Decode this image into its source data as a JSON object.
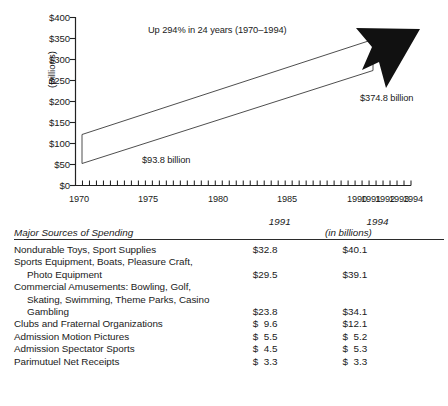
{
  "chart_data": {
    "type": "area",
    "title": "Up 294% in 24 years (1970–1994)",
    "xlabel": "",
    "ylabel": "(Billions)",
    "ylim": [
      0,
      400
    ],
    "xlim": [
      1970,
      1994
    ],
    "grid": false,
    "legend": "none",
    "y_ticks": [
      "$0",
      "$50",
      "$100",
      "$150",
      "$200",
      "$250",
      "$300",
      "$350",
      "$400"
    ],
    "y_tick_values": [
      0,
      50,
      100,
      150,
      200,
      250,
      300,
      350,
      400
    ],
    "x_ticks": [
      "1970",
      "1975",
      "1980",
      "1985",
      "1990",
      "1991",
      "1992",
      "1993",
      "1994"
    ],
    "x_tick_values": [
      1970,
      1975,
      1980,
      1985,
      1990,
      1991,
      1992,
      1993,
      1994
    ],
    "minor_ticks_per_year": 2,
    "x": [
      1970,
      1994
    ],
    "values": [
      93.8,
      374.8
    ],
    "annotations": [
      {
        "name": "start-value",
        "text": "$93.8 billion",
        "x": 1970,
        "y": 93.8
      },
      {
        "name": "end-value",
        "text": "$374.8 billion",
        "x": 1994,
        "y": 374.8
      },
      {
        "name": "growth",
        "text": "Up 294% in 24 years (1970–1994)"
      }
    ],
    "arrow_color": "#111111",
    "ribbon_stroke": "#333333",
    "ribbon_fill": "#ffffff"
  },
  "chart": {
    "y_axis_label": "(Billions)",
    "y_ticks": [
      "$400",
      "$350",
      "$300",
      "$250",
      "$200",
      "$150",
      "$100",
      "$50",
      "$0"
    ],
    "x_ticks": [
      "1970",
      "1975",
      "1980",
      "1985",
      "1990",
      "1991",
      "1992",
      "1993",
      "1994"
    ],
    "annotation_title": "Up 294% in 24 years (1970–1994)",
    "start_label": "$93.8 billion",
    "end_label": "$374.8 billion"
  },
  "table": {
    "title": "Major Sources of Spending",
    "year_1991": "1991",
    "year_1994": "1994",
    "units": "(in billions)",
    "rows": [
      {
        "lines": [
          "Nondurable Toys, Sport Supplies"
        ],
        "indent_lines": [],
        "v1991": "$32.8",
        "v1994": "$40.1"
      },
      {
        "lines": [
          "Sports Equipment, Boats, Pleasure Craft,"
        ],
        "indent_lines": [
          "Photo Equipment"
        ],
        "v1991": "$29.5",
        "v1994": "$39.1"
      },
      {
        "lines": [
          "Commercial Amusements: Bowling, Golf,"
        ],
        "indent_lines": [
          "Skating, Swimming, Theme Parks, Casino",
          "Gambling"
        ],
        "v1991": "$23.8",
        "v1994": "$34.1"
      },
      {
        "lines": [
          "Clubs and Fraternal Organizations"
        ],
        "indent_lines": [],
        "v1991": "$  9.6",
        "v1994": "$12.1"
      },
      {
        "lines": [
          "Admission Motion Pictures"
        ],
        "indent_lines": [],
        "v1991": "$  5.5",
        "v1994": "$  5.2"
      },
      {
        "lines": [
          "Admission Spectator Sports"
        ],
        "indent_lines": [],
        "v1991": "$  4.5",
        "v1994": "$  5.3"
      },
      {
        "lines": [
          "Parimutuel Net Receipts"
        ],
        "indent_lines": [],
        "v1991": "$  3.3",
        "v1994": "$  3.3"
      }
    ]
  }
}
